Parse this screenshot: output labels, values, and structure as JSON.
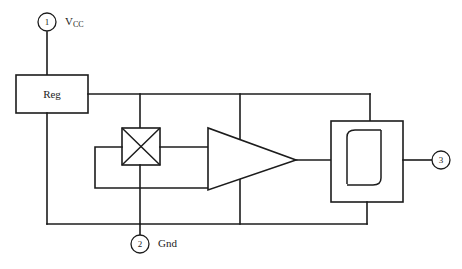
{
  "diagram": {
    "type": "block-diagram",
    "background_color": "#ffffff",
    "line_color": "#1c1c1c",
    "blocks": [
      {
        "id": "regulator",
        "label": "Reg",
        "name": "voltage-regulator-block",
        "shape": "rectangle"
      },
      {
        "id": "multiplier",
        "label": "",
        "glyph": "cross-x",
        "name": "hall-element-block",
        "shape": "rectangle-with-x"
      },
      {
        "id": "amplifier",
        "label": "",
        "name": "amplifier-block",
        "shape": "triangle"
      },
      {
        "id": "schmitt",
        "label": "",
        "glyph": "hysteresis",
        "name": "schmitt-trigger-block",
        "shape": "rectangle-with-hysteresis"
      }
    ],
    "pins": [
      {
        "number": "1",
        "label": "V",
        "sublabel": "CC",
        "name": "pin-1-vcc",
        "position": "top-left"
      },
      {
        "number": "2",
        "label": "Gnd",
        "sublabel": "",
        "name": "pin-2-gnd",
        "position": "bottom-center"
      },
      {
        "number": "3",
        "label": "",
        "sublabel": "",
        "name": "pin-3-output",
        "position": "right"
      }
    ]
  }
}
